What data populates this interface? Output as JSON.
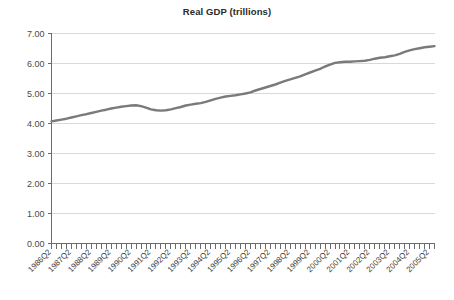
{
  "chart_data": {
    "type": "line",
    "title": "Real GDP (trillions)",
    "xlabel": "",
    "ylabel": "",
    "ylim": [
      0,
      7
    ],
    "ytick_step": 1,
    "ytick_labels": [
      "0.00",
      "1.00",
      "2.00",
      "3.00",
      "4.00",
      "5.00",
      "6.00",
      "7.00"
    ],
    "ytick_values": [
      0,
      1,
      2,
      3,
      4,
      5,
      6,
      7
    ],
    "grid": true,
    "legend": "none",
    "line_color": "#7a7a7a",
    "gridline_color": "#d9d9d9",
    "axis_color": "#6b6b6b",
    "x_tick_labels": [
      "1986Q2",
      "1987Q2",
      "1988Q2",
      "1989Q2",
      "1990Q2",
      "1991Q2",
      "1992Q2",
      "1993Q2",
      "1994Q2",
      "1995Q2",
      "1996Q2",
      "1997Q2",
      "1998Q2",
      "1999Q2",
      "2000Q2",
      "2001Q2",
      "2002Q2",
      "2003Q2",
      "2004Q2",
      "2005Q2"
    ],
    "x_label_rotation_deg": 45,
    "x_start_quarter": "1986Q2",
    "x_end_quarter": "2005Q3",
    "x_tick_interval": "quarterly",
    "x_label_interval": "annual (Q2)",
    "series": [
      {
        "name": "Real GDP",
        "values": [
          4.07,
          4.1,
          4.13,
          4.16,
          4.2,
          4.24,
          4.28,
          4.31,
          4.35,
          4.39,
          4.43,
          4.46,
          4.5,
          4.53,
          4.56,
          4.58,
          4.6,
          4.61,
          4.58,
          4.53,
          4.47,
          4.44,
          4.43,
          4.44,
          4.47,
          4.51,
          4.55,
          4.6,
          4.63,
          4.66,
          4.68,
          4.72,
          4.77,
          4.82,
          4.86,
          4.9,
          4.92,
          4.94,
          4.97,
          5.0,
          5.04,
          5.1,
          5.15,
          5.2,
          5.25,
          5.3,
          5.36,
          5.42,
          5.47,
          5.52,
          5.57,
          5.64,
          5.7,
          5.76,
          5.82,
          5.9,
          5.96,
          6.02,
          6.04,
          6.06,
          6.06,
          6.07,
          6.08,
          6.09,
          6.12,
          6.16,
          6.19,
          6.21,
          6.24,
          6.27,
          6.32,
          6.39,
          6.44,
          6.48,
          6.51,
          6.54,
          6.56,
          6.58
        ]
      }
    ]
  }
}
